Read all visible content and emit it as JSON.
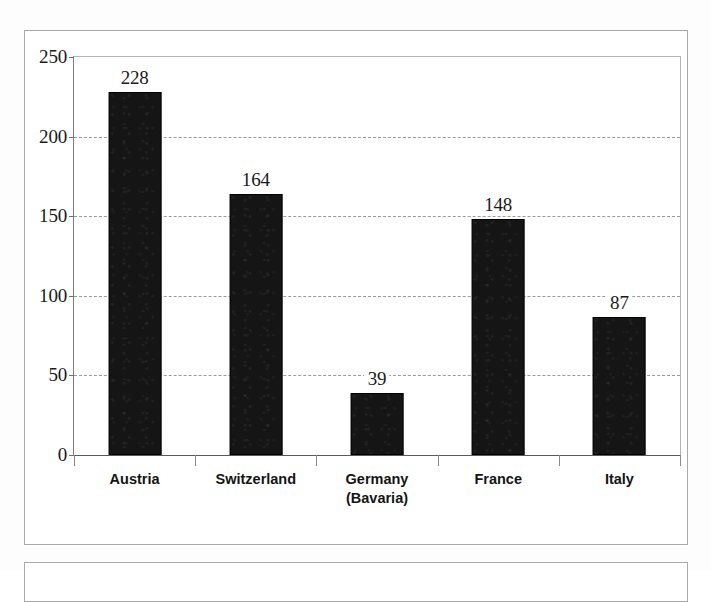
{
  "figure": {
    "border_color": "#a9a9a9",
    "background_color": "#ffffff"
  },
  "chart_data": {
    "type": "bar",
    "title": "",
    "subtitle": "",
    "xlabel": "",
    "ylabel": "",
    "categories": [
      "Austria",
      "Switzerland",
      "Germany\n(Bavaria)",
      "France",
      "Italy"
    ],
    "values": [
      228,
      164,
      39,
      148,
      87
    ],
    "data_labels": [
      "228",
      "164",
      "39",
      "148",
      "87"
    ],
    "ylim": [
      0,
      250
    ],
    "ytick_values": [
      0,
      50,
      100,
      150,
      200,
      250
    ],
    "ytick_labels": [
      "0",
      "50",
      "100",
      "150",
      "200",
      "250"
    ],
    "grid": true,
    "grid_axis": "y",
    "grid_style": "dashed",
    "grid_color": "#9b9b9b",
    "bar_color": "#151515",
    "legend": null,
    "legend_position": "none",
    "annotations": []
  }
}
